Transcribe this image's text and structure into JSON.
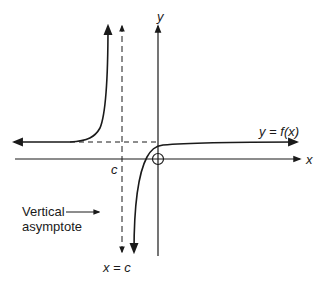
{
  "diagram": {
    "labels": {
      "y_axis": "y",
      "x_axis": "x",
      "function": "y = f(x)",
      "c_tick": "c",
      "asymptote_eq": "x = c",
      "annotation_line1": "Vertical",
      "annotation_line2": "asymptote"
    },
    "elements": [
      {
        "name": "x-axis",
        "type": "axis",
        "direction": "horizontal"
      },
      {
        "name": "y-axis",
        "type": "axis",
        "direction": "vertical"
      },
      {
        "name": "vertical-asymptote",
        "type": "dashed-line",
        "equation": "x = c"
      },
      {
        "name": "horizontal-asymptote",
        "type": "dashed-line"
      },
      {
        "name": "left-branch",
        "type": "curve"
      },
      {
        "name": "right-branch",
        "type": "curve"
      },
      {
        "name": "origin-circle",
        "type": "open-circle",
        "at": "origin"
      }
    ],
    "colors": {
      "stroke": "#1a1a1a",
      "background": "#ffffff"
    }
  }
}
